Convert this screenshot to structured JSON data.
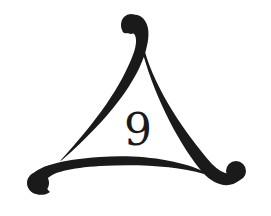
{
  "figure": {
    "center_label": "9",
    "colors": {
      "background": "#ffffff",
      "stroke": "#1a1a1a"
    },
    "strokes": [
      {
        "name": "top-left-stroke",
        "terminal": "top"
      },
      {
        "name": "right-stroke",
        "terminal": "bottom-right"
      },
      {
        "name": "bottom-stroke",
        "terminal": "bottom-left"
      }
    ]
  }
}
